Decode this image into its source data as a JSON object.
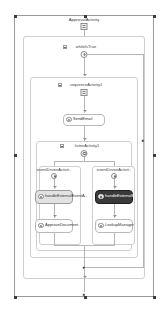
{
  "designer": {
    "title": "Workflow Designer",
    "root_activity": {
      "label": "ApprovalActivity",
      "icon": "sequence-icon"
    },
    "while_activity": {
      "label": "whileIsTrue",
      "icon": "while-icon",
      "expander": "collapse-toggle"
    },
    "sequence_activity": {
      "label": "sequenceActivity1",
      "icon": "sequence-icon",
      "expander": "collapse-toggle"
    },
    "send_email_activity": {
      "label": "SendEmail",
      "icon": "activity-icon"
    },
    "listen_activity": {
      "label": "listenActivity1",
      "icon": "listen-icon",
      "expander": "collapse-toggle"
    },
    "branches": [
      {
        "label": "eventDrivenActivit..",
        "icon": "event-driven-icon",
        "nodes": [
          {
            "label": "handleExternalEventA..",
            "icon": "activity-icon",
            "state": "hovered"
          },
          {
            "label": "ApproveDocument",
            "icon": "activity-icon",
            "state": "normal"
          }
        ]
      },
      {
        "label": "eventDrivenActivit..",
        "icon": "event-driven-icon",
        "nodes": [
          {
            "label": "handleExternalE..",
            "icon": "activity-icon",
            "state": "selected"
          },
          {
            "label": "LookupManager",
            "icon": "activity-icon",
            "state": "normal"
          }
        ]
      }
    ],
    "colors": {
      "selection_handle": "#3c3c3c",
      "selected_node_bg": "#3a3a3a",
      "hovered_node_bg": "#e2e2e2",
      "connector": "#b5b5b5",
      "frame_border": "#9a9a9a",
      "canvas_bg": "#ffffff"
    }
  }
}
